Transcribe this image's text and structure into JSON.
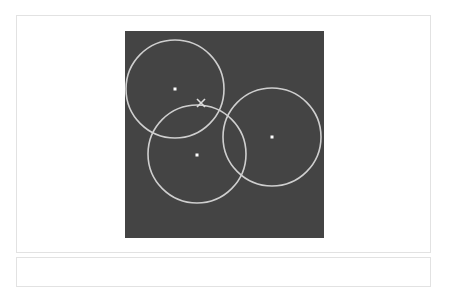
{
  "canvas": {
    "width": 199,
    "height": 207,
    "background": "#444444",
    "stroke_color": "#cfcfcf",
    "dot_color": "#ffffff",
    "marker_color": "#dddddd"
  },
  "circles": [
    {
      "id": "circle-1",
      "cx": 50,
      "cy": 58,
      "r": 49
    },
    {
      "id": "circle-2",
      "cx": 72,
      "cy": 123,
      "r": 49
    },
    {
      "id": "circle-3",
      "cx": 147,
      "cy": 106,
      "r": 49
    }
  ],
  "centers": [
    {
      "id": "center-1",
      "x": 50,
      "y": 58
    },
    {
      "id": "center-2",
      "x": 72,
      "y": 124
    },
    {
      "id": "center-3",
      "x": 147,
      "y": 106
    }
  ],
  "marker": {
    "type": "x",
    "x": 76,
    "y": 72,
    "size": 4
  }
}
